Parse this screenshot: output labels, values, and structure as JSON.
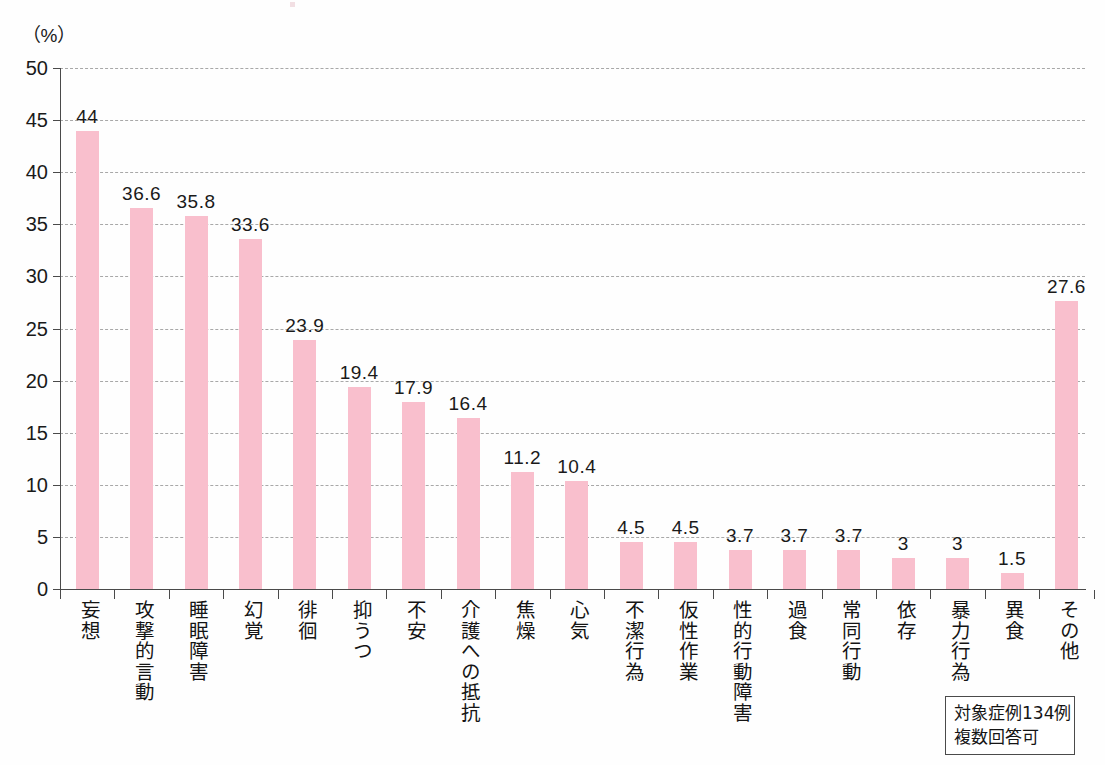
{
  "unit_label": "（%）",
  "note": {
    "line1": "対象症例134例",
    "line2": "複数回答可"
  },
  "colors": {
    "bar": "#f9bfcd",
    "axis": "#4a4a4a",
    "grid": "#9a9a9a",
    "text": "#1a1a1a"
  },
  "chart_data": {
    "type": "bar",
    "title": "",
    "subtitle": "",
    "xlabel": "",
    "ylabel": "（%）",
    "ylim": [
      0,
      50
    ],
    "ytick_step": 5,
    "yticks": [
      0,
      5,
      10,
      15,
      20,
      25,
      30,
      35,
      40,
      45,
      50
    ],
    "ytick_labels": [
      "0",
      "5",
      "10",
      "15",
      "20",
      "25",
      "30",
      "35",
      "40",
      "45",
      "50"
    ],
    "grid": true,
    "grid_style": "dashed-horizontal",
    "legend": false,
    "legend_position": "none",
    "annotations": [
      "対象症例134例",
      "複数回答可"
    ],
    "categories": [
      "妄想",
      "攻撃的言動",
      "睡眠障害",
      "幻覚",
      "徘徊",
      "抑うつ",
      "不安",
      "介護への抵抗",
      "焦燥",
      "心気",
      "不潔行為",
      "仮性作業",
      "性的行動障害",
      "過食",
      "常同行動",
      "依存",
      "暴力行為",
      "異食",
      "その他"
    ],
    "values": [
      44,
      36.6,
      35.8,
      33.6,
      23.9,
      19.4,
      17.9,
      16.4,
      11.2,
      10.4,
      4.5,
      4.5,
      3.7,
      3.7,
      3.7,
      3,
      3,
      1.5,
      27.6
    ],
    "value_labels": [
      "44",
      "36.6",
      "35.8",
      "33.6",
      "23.9",
      "19.4",
      "17.9",
      "16.4",
      "11.2",
      "10.4",
      "4.5",
      "4.5",
      "3.7",
      "3.7",
      "3.7",
      "3",
      "3",
      "1.5",
      "27.6"
    ]
  }
}
